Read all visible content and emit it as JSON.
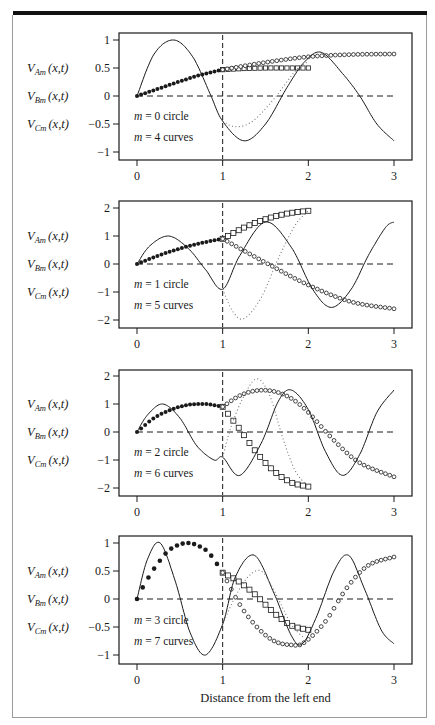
{
  "figure": {
    "x_axis_label": "Distance from the left end",
    "y_labels": [
      {
        "main": "V",
        "sub": "Am",
        "rest": "(x,t)"
      },
      {
        "main": "V",
        "sub": "Bm",
        "rest": "(x,t)"
      },
      {
        "main": "V",
        "sub": "Cm",
        "rest": "(x,t)"
      }
    ],
    "colors": {
      "ink": "#1a1a1a",
      "frame": "#9a9a9a",
      "topbar": "#111111",
      "dotted": "#777777"
    }
  },
  "chart_data": [
    {
      "type": "line",
      "title": "",
      "annotations": [
        "m = 0 circle",
        "m = 4 curves"
      ],
      "xlabel": "",
      "ylabel": "V_Am(x,t), V_Bm(x,t), V_Cm(x,t)",
      "xlim": [
        0,
        3
      ],
      "ylim": [
        -1,
        1
      ],
      "xticks": [
        "0",
        "1",
        "2",
        "3"
      ],
      "yticks": [
        "1",
        "0.5",
        "0",
        "-0.5",
        "-1"
      ],
      "series": [
        {
          "name": "m=0 circle (filled dots, segment A)",
          "marker": "filled-circle",
          "x": [
            0,
            0.25,
            0.5,
            0.75,
            1.0
          ],
          "y": [
            0,
            0.13,
            0.26,
            0.38,
            0.47
          ]
        },
        {
          "name": "m=0 circle (squares, segment B)",
          "marker": "open-square",
          "x": [
            1.0,
            1.25,
            1.5,
            1.75,
            2.0
          ],
          "y": [
            0.47,
            0.49,
            0.5,
            0.5,
            0.5
          ]
        },
        {
          "name": "m=0 circle (open circles, segment C)",
          "marker": "open-circle",
          "x": [
            1.0,
            1.5,
            2.0,
            2.5,
            3.0
          ],
          "y": [
            0.47,
            0.6,
            0.7,
            0.74,
            0.75
          ]
        },
        {
          "name": "m=4 curve (solid)",
          "style": "solid",
          "x": [
            0,
            0.2,
            0.43,
            0.65,
            0.85,
            1.0,
            1.25,
            1.5,
            1.75,
            1.95,
            2.15,
            2.4,
            2.6,
            2.8,
            3.0
          ],
          "y": [
            0,
            0.75,
            1.0,
            0.7,
            0.05,
            -0.45,
            -0.8,
            -0.5,
            0.15,
            0.6,
            0.78,
            0.4,
            0.0,
            -0.5,
            -0.8
          ]
        },
        {
          "name": "m=4 curve (dotted)",
          "style": "dotted",
          "x": [
            1.0,
            1.15,
            1.35,
            1.6,
            1.85,
            2.0
          ],
          "y": [
            -0.45,
            -0.55,
            -0.45,
            -0.05,
            0.45,
            0.62
          ]
        }
      ],
      "reference_lines": {
        "horizontal_dashed_y": 0,
        "vertical_dashed_x": 1
      }
    },
    {
      "type": "line",
      "title": "",
      "annotations": [
        "m = 1 circle",
        "m = 5 curves"
      ],
      "xlim": [
        0,
        3
      ],
      "ylim": [
        -2,
        2
      ],
      "xticks": [
        "0",
        "1",
        "2",
        "3"
      ],
      "yticks": [
        "2",
        "1",
        "0",
        "-1",
        "-2"
      ],
      "series": [
        {
          "name": "m=1 circle (filled dots)",
          "marker": "filled-circle",
          "x": [
            0,
            0.25,
            0.5,
            0.75,
            1.0
          ],
          "y": [
            0,
            0.3,
            0.55,
            0.75,
            0.9
          ]
        },
        {
          "name": "m=1 circle (squares)",
          "marker": "open-square",
          "x": [
            1.0,
            1.25,
            1.5,
            1.75,
            2.0
          ],
          "y": [
            0.9,
            1.3,
            1.6,
            1.8,
            1.9
          ]
        },
        {
          "name": "m=1 circle (open circles)",
          "marker": "open-circle",
          "x": [
            1.0,
            1.5,
            2.0,
            2.5,
            3.0
          ],
          "y": [
            0.9,
            0.05,
            -0.75,
            -1.35,
            -1.6
          ]
        },
        {
          "name": "m=5 curve (solid)",
          "style": "solid",
          "x": [
            0,
            0.15,
            0.37,
            0.6,
            0.8,
            1.0,
            1.2,
            1.5,
            1.8,
            2.05,
            2.27,
            2.5,
            2.7,
            2.9,
            3.0
          ],
          "y": [
            0,
            0.65,
            1.0,
            0.55,
            -0.2,
            -0.9,
            0.3,
            1.5,
            0.6,
            -0.9,
            -1.55,
            -0.9,
            0.3,
            1.3,
            1.5
          ]
        },
        {
          "name": "m=5 curve (dotted)",
          "style": "dotted",
          "x": [
            1.0,
            1.12,
            1.25,
            1.45,
            1.65,
            1.85,
            2.0
          ],
          "y": [
            -0.9,
            -1.7,
            -1.95,
            -1.2,
            0.2,
            1.4,
            1.9
          ]
        }
      ],
      "reference_lines": {
        "horizontal_dashed_y": 0,
        "vertical_dashed_x": 1
      }
    },
    {
      "type": "line",
      "title": "",
      "annotations": [
        "m = 2 circle",
        "m = 6 curves"
      ],
      "xlim": [
        0,
        3
      ],
      "ylim": [
        -2,
        2
      ],
      "xticks": [
        "0",
        "1",
        "2",
        "3"
      ],
      "yticks": [
        "2",
        "1",
        "0",
        "-1",
        "-2"
      ],
      "series": [
        {
          "name": "m=2 circle (filled dots)",
          "marker": "filled-circle",
          "x": [
            0,
            0.2,
            0.4,
            0.6,
            0.8,
            1.0
          ],
          "y": [
            0,
            0.5,
            0.8,
            0.97,
            1.0,
            0.9
          ]
        },
        {
          "name": "m=2 circle (squares)",
          "marker": "open-square",
          "x": [
            1.0,
            1.2,
            1.4,
            1.6,
            1.8,
            2.0
          ],
          "y": [
            0.9,
            0.1,
            -0.75,
            -1.4,
            -1.8,
            -1.95
          ]
        },
        {
          "name": "m=2 circle (open circles)",
          "marker": "open-circle",
          "x": [
            1.0,
            1.2,
            1.4,
            1.6,
            1.8,
            2.0,
            2.3,
            2.6,
            3.0
          ],
          "y": [
            0.9,
            1.3,
            1.48,
            1.45,
            1.2,
            0.7,
            -0.3,
            -1.1,
            -1.6
          ]
        },
        {
          "name": "m=6 curve (solid)",
          "style": "solid",
          "x": [
            0,
            0.12,
            0.3,
            0.5,
            0.7,
            0.9,
            1.0,
            1.2,
            1.45,
            1.65,
            1.8,
            2.0,
            2.2,
            2.4,
            2.6,
            2.8,
            3.0
          ],
          "y": [
            0,
            0.6,
            1.0,
            0.5,
            -0.5,
            -1.0,
            -0.9,
            -1.55,
            -0.4,
            1.1,
            1.5,
            0.8,
            -0.7,
            -1.55,
            -0.8,
            0.7,
            1.5
          ]
        },
        {
          "name": "m=6 curve (dotted)",
          "style": "dotted",
          "x": [
            1.0,
            1.1,
            1.25,
            1.4,
            1.55,
            1.7,
            1.85,
            2.0
          ],
          "y": [
            -0.9,
            0.2,
            1.3,
            1.9,
            1.3,
            -0.2,
            -1.4,
            -1.95
          ]
        }
      ],
      "reference_lines": {
        "horizontal_dashed_y": 0,
        "vertical_dashed_x": 1
      }
    },
    {
      "type": "line",
      "title": "",
      "annotations": [
        "m = 3 circle",
        "m = 7 curves"
      ],
      "xlabel": "Distance from the left end",
      "xlim": [
        0,
        3
      ],
      "ylim": [
        -1,
        1
      ],
      "xticks": [
        "0",
        "1",
        "2",
        "3"
      ],
      "yticks": [
        "1",
        "0.5",
        "0",
        "-0.5",
        "-1"
      ],
      "series": [
        {
          "name": "m=3 circle (filled dots)",
          "marker": "filled-circle",
          "x": [
            0,
            0.1,
            0.25,
            0.4,
            0.6,
            0.8,
            0.9,
            1.0
          ],
          "y": [
            0,
            0.3,
            0.65,
            0.9,
            1.0,
            0.88,
            0.7,
            0.47
          ]
        },
        {
          "name": "m=3 circle (squares)",
          "marker": "open-square",
          "x": [
            1.0,
            1.2,
            1.4,
            1.6,
            1.8,
            2.0
          ],
          "y": [
            0.47,
            0.3,
            0.05,
            -0.25,
            -0.47,
            -0.55
          ]
        },
        {
          "name": "m=3 circle (open circles)",
          "marker": "open-circle",
          "x": [
            1.0,
            1.2,
            1.4,
            1.6,
            1.8,
            1.95,
            2.2,
            2.45,
            2.7,
            3.0
          ],
          "y": [
            0.47,
            -0.1,
            -0.5,
            -0.75,
            -0.82,
            -0.78,
            -0.4,
            0.2,
            0.6,
            0.75
          ]
        },
        {
          "name": "m=7 curve (solid)",
          "style": "solid",
          "x": [
            0,
            0.12,
            0.27,
            0.45,
            0.62,
            0.8,
            1.0,
            1.15,
            1.37,
            1.6,
            1.8,
            1.93,
            2.1,
            2.3,
            2.47,
            2.65,
            2.85,
            3.0
          ],
          "y": [
            0,
            0.7,
            1.0,
            0.3,
            -0.6,
            -1.0,
            -0.45,
            0.4,
            0.78,
            0.1,
            -0.65,
            -0.8,
            -0.3,
            0.5,
            0.78,
            0.2,
            -0.55,
            -0.8
          ]
        },
        {
          "name": "m=7 curve (dotted)",
          "style": "dotted",
          "x": [
            1.0,
            1.15,
            1.3,
            1.45,
            1.6,
            1.8,
            1.95
          ],
          "y": [
            -0.45,
            0.05,
            0.4,
            0.5,
            0.15,
            -0.45,
            -0.7
          ]
        }
      ],
      "reference_lines": {
        "horizontal_dashed_y": 0,
        "vertical_dashed_x": 1
      }
    }
  ],
  "layout": {
    "panels": [
      {
        "top": 33,
        "bottom": 160,
        "y_top_px": 40,
        "y_bot_px": 152
      },
      {
        "top": 201,
        "bottom": 328,
        "y_top_px": 208,
        "y_bot_px": 320
      },
      {
        "top": 370,
        "bottom": 496,
        "y_top_px": 376,
        "y_bot_px": 488
      },
      {
        "top": 536,
        "bottom": 664,
        "y_top_px": 543,
        "y_bot_px": 655
      }
    ],
    "box_left": 119,
    "box_right": 412,
    "x0_px": 137,
    "x3_px": 394
  }
}
